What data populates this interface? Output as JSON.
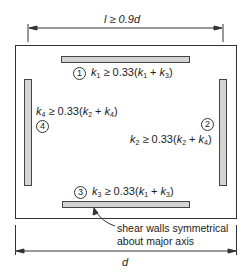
{
  "caption": "",
  "dimensions": {
    "top_label": "l ≥ 0.9d",
    "bottom_label": "d"
  },
  "walls": [
    {
      "id": "1",
      "position": "top",
      "symbol": "k",
      "sub": "1",
      "rel": "≥ 0.33(",
      "a": "k",
      "a_sub": "1",
      "plus": " + ",
      "b": "k",
      "b_sub": "3",
      "close": ")"
    },
    {
      "id": "2",
      "position": "right",
      "symbol": "k",
      "sub": "2",
      "rel": "≥ 0.33(",
      "a": "k",
      "a_sub": "2",
      "plus": " + ",
      "b": "k",
      "b_sub": "4",
      "close": ")"
    },
    {
      "id": "3",
      "position": "bottom",
      "symbol": "k",
      "sub": "3",
      "rel": "≥ 0.33(",
      "a": "k",
      "a_sub": "1",
      "plus": " + ",
      "b": "k",
      "b_sub": "3",
      "close": ")"
    },
    {
      "id": "4",
      "position": "left",
      "symbol": "k",
      "sub": "4",
      "rel": "≥ 0.33(",
      "a": "k",
      "a_sub": "2",
      "plus": " + ",
      "b": "k",
      "b_sub": "4",
      "close": ")"
    }
  ],
  "annotation": {
    "line1": "shear walls symmetrical",
    "line2": "about major axis"
  },
  "colors": {
    "wall_fill": "#d4d4d4",
    "wall_stroke": "#444444",
    "line": "#333333"
  }
}
